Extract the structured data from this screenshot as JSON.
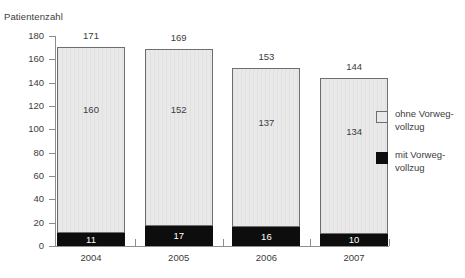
{
  "chart_data": {
    "type": "bar",
    "title": "Patientenzahl",
    "xlabel": "",
    "ylabel": "Patientenzahl",
    "ylim": [
      0,
      180
    ],
    "ytick_step": 20,
    "grid": false,
    "stacked": true,
    "legend_position": "right",
    "categories": [
      "2004",
      "2005",
      "2006",
      "2007"
    ],
    "yticks": [
      "180",
      "160",
      "140",
      "120",
      "100",
      "80",
      "60",
      "40",
      "20",
      "0"
    ],
    "ytick_values": [
      180,
      160,
      140,
      120,
      100,
      80,
      60,
      40,
      20,
      0
    ],
    "series": [
      {
        "name": "ohne Vorwegvollzug",
        "color": "#e9e9e9",
        "values": [
          160,
          152,
          137,
          134
        ]
      },
      {
        "name": "mit Vorwegvollzug",
        "color": "#0d0d0d",
        "values": [
          11,
          17,
          16,
          10
        ]
      }
    ],
    "totals": [
      171,
      169,
      153,
      144
    ],
    "annotations": {
      "total_labels": [
        "171",
        "169",
        "153",
        "144"
      ],
      "light_labels": [
        "160",
        "152",
        "137",
        "134"
      ],
      "dark_labels": [
        "11",
        "17",
        "16",
        "10"
      ]
    },
    "legend": [
      {
        "line1": "ohne Vorweg-",
        "line2": "vollzug",
        "swatch": "light"
      },
      {
        "line1": "mit Vorweg-",
        "line2": "vollzug",
        "swatch": "dark"
      }
    ]
  }
}
